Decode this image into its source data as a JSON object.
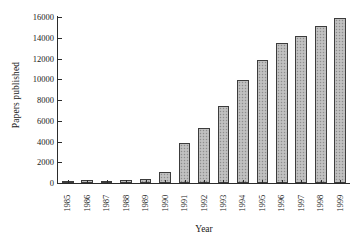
{
  "chart_data": {
    "type": "bar",
    "title": "",
    "xlabel": "Year",
    "ylabel": "Papers published",
    "categories": [
      "1985",
      "1986",
      "1987",
      "1988",
      "1989",
      "1990",
      "1991",
      "1992",
      "1993",
      "1994",
      "1995",
      "1996",
      "1997",
      "1998",
      "1999"
    ],
    "values": [
      220,
      250,
      240,
      270,
      390,
      1020,
      3900,
      5300,
      7450,
      9900,
      11900,
      13500,
      14200,
      15150,
      15950
    ],
    "series": [
      {
        "name": "Papers published",
        "values": [
          220,
          250,
          240,
          270,
          390,
          1020,
          3900,
          5300,
          7450,
          9900,
          11900,
          13500,
          14200,
          15150,
          15950
        ]
      }
    ],
    "yticks": [
      0,
      2000,
      4000,
      6000,
      8000,
      10000,
      12000,
      14000,
      16000
    ],
    "ytick_labels": [
      "0",
      "2000",
      "4000",
      "6000",
      "8000",
      "10000",
      "12000",
      "14000",
      "16000"
    ],
    "ylim": [
      0,
      16000
    ],
    "xlim_categories": 15,
    "grid": false,
    "legend": null,
    "bar_color": "#b9b9b9",
    "bar_edge_color": "#3c3c3c",
    "axis_color": "#2b2b2b",
    "background": "#ffffff",
    "tick_direction": "in",
    "spines": [
      "left",
      "bottom"
    ]
  }
}
